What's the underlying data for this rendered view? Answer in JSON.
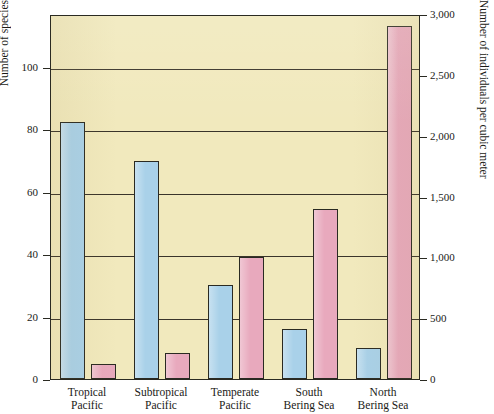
{
  "chart_data": {
    "type": "bar",
    "title": "",
    "subtitle": "",
    "categories": [
      "Tropical Pacific",
      "Subtropical Pacific",
      "Temperate Pacific",
      "South Bering Sea",
      "North Bering Sea"
    ],
    "category_lines": [
      [
        "Tropical",
        "Pacific"
      ],
      [
        "Subtropical",
        "Pacific"
      ],
      [
        "Temperate",
        "Pacific"
      ],
      [
        "South",
        "Bering Sea"
      ],
      [
        "North",
        "Bering Sea"
      ]
    ],
    "series": [
      {
        "name": "Number of species",
        "axis": "left",
        "color": "#a9d1e9",
        "values": [
          82.5,
          70,
          30,
          16,
          10
        ]
      },
      {
        "name": "Number of individuals per cubic meter",
        "axis": "right",
        "color": "#e8a9bd",
        "values": [
          120,
          210,
          1000,
          1400,
          2900
        ]
      }
    ],
    "xlabel": "",
    "ylabel_left": "Number of species",
    "ylabel_right": "Number of individuals per cubic meter",
    "ylim_left": [
      0,
      117
    ],
    "ylim_right": [
      0,
      3000
    ],
    "yticks_left": [
      0,
      20,
      40,
      60,
      80,
      100
    ],
    "ytick_labels_left": [
      "0",
      "20",
      "40",
      "60",
      "80",
      "100"
    ],
    "yticks_right": [
      0,
      500,
      1000,
      1500,
      2000,
      2500,
      3000
    ],
    "ytick_labels_right": [
      "0",
      "500",
      "1,000",
      "1,500",
      "2,000",
      "2,500",
      "3,000"
    ],
    "grid": true,
    "gridlines_at_left_ticks": [
      20,
      40,
      60,
      80,
      100
    ],
    "legend": "none",
    "plot_background": "#f1e9bd",
    "axis_color": "#2a2a22"
  }
}
